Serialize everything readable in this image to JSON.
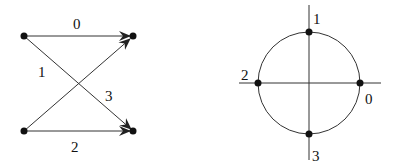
{
  "left_diagram": {
    "type": "bipartite-graph",
    "nodes": [
      {
        "id": "left-top",
        "x": 24,
        "y": 36
      },
      {
        "id": "right-top",
        "x": 133,
        "y": 36
      },
      {
        "id": "left-bottom",
        "x": 24,
        "y": 131
      },
      {
        "id": "right-bottom",
        "x": 133,
        "y": 131
      }
    ],
    "edges": [
      {
        "label": "0",
        "from": "left-top",
        "to": "right-top",
        "label_x": 77,
        "label_y": 29
      },
      {
        "label": "1",
        "from": "left-top",
        "to": "right-bottom",
        "label_x": 42,
        "label_y": 76
      },
      {
        "label": "2",
        "from": "left-bottom",
        "to": "right-bottom",
        "label_x": 75,
        "label_y": 151
      },
      {
        "label": "3",
        "from": "left-bottom",
        "to": "right-top",
        "label_x": 109,
        "label_y": 100
      }
    ]
  },
  "right_diagram": {
    "type": "unit-circle",
    "center": {
      "x": 309,
      "y": 83
    },
    "radius": 51,
    "points": [
      {
        "label": "0",
        "angle_deg": 0,
        "label_x": 369,
        "label_y": 103
      },
      {
        "label": "1",
        "angle_deg": 90,
        "label_x": 315,
        "label_y": 23
      },
      {
        "label": "2",
        "angle_deg": 180,
        "label_x": 243,
        "label_y": 79
      },
      {
        "label": "3",
        "angle_deg": 270,
        "label_x": 314,
        "label_y": 160
      }
    ]
  },
  "colors": {
    "ink": "#111111",
    "line": "#333333",
    "background": "#ffffff"
  }
}
